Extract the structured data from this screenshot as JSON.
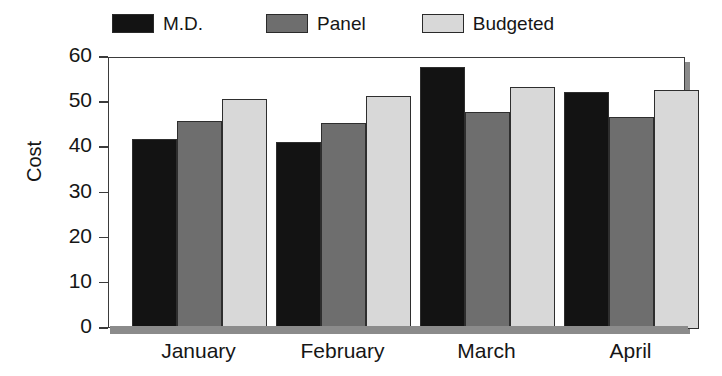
{
  "chart_data": {
    "type": "bar",
    "title": "",
    "xlabel": "",
    "ylabel": "Cost",
    "categories": [
      "January",
      "February",
      "March",
      "April"
    ],
    "series": [
      {
        "name": "M.D.",
        "color": "#131313",
        "values": [
          42,
          41.5,
          58,
          52.5
        ]
      },
      {
        "name": "Panel",
        "color": "#6e6e6e",
        "values": [
          46,
          45.5,
          48,
          47
        ]
      },
      {
        "name": "Budgeted",
        "color": "#d8d8d8",
        "values": [
          51,
          51.5,
          53.5,
          53
        ]
      }
    ],
    "ylim": [
      0,
      60
    ],
    "yticks": [
      0,
      10,
      20,
      30,
      40,
      50,
      60
    ],
    "ytick_labels": [
      "0",
      "10",
      "20",
      "30",
      "40",
      "50",
      "60"
    ],
    "grid": false,
    "legend_position": "top"
  }
}
